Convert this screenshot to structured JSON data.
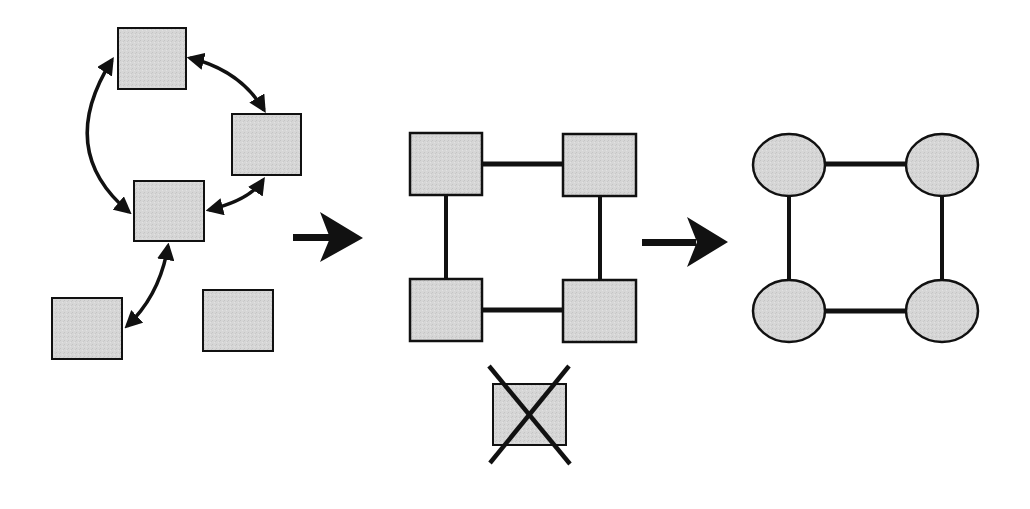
{
  "diagram": {
    "title": "",
    "background": "#ffffff",
    "colors": {
      "node_fill": "#d4d4d4",
      "stroke": "#111111"
    },
    "panels": [
      {
        "id": "unstructured",
        "description": "Five square nodes, four connected in a ring by curved double-headed arrows, one isolated",
        "nodes": [
          {
            "id": "A",
            "shape": "square",
            "x": 118,
            "y": 28,
            "w": 68,
            "h": 61
          },
          {
            "id": "B",
            "shape": "square",
            "x": 232,
            "y": 114,
            "w": 69,
            "h": 61
          },
          {
            "id": "C",
            "shape": "square",
            "x": 134,
            "y": 181,
            "w": 70,
            "h": 60
          },
          {
            "id": "D",
            "shape": "square",
            "x": 52,
            "y": 298,
            "w": 70,
            "h": 61
          },
          {
            "id": "E",
            "shape": "square",
            "x": 203,
            "y": 290,
            "w": 70,
            "h": 61
          }
        ],
        "edges": [
          {
            "from": "A",
            "to": "B",
            "type": "curved-double-arrow"
          },
          {
            "from": "B",
            "to": "C",
            "type": "curved-double-arrow"
          },
          {
            "from": "A",
            "to": "C",
            "type": "curved-double-arrow"
          },
          {
            "from": "C",
            "to": "D",
            "type": "curved-double-arrow"
          }
        ]
      },
      {
        "id": "square-grid",
        "description": "Four square nodes connected in a square; one removed (crossed out) node below",
        "nodes": [
          {
            "id": "TL",
            "shape": "square",
            "x": 410,
            "y": 133,
            "w": 72,
            "h": 62
          },
          {
            "id": "TR",
            "shape": "square",
            "x": 563,
            "y": 134,
            "w": 73,
            "h": 62
          },
          {
            "id": "BL",
            "shape": "square",
            "x": 410,
            "y": 279,
            "w": 72,
            "h": 62
          },
          {
            "id": "BR",
            "shape": "square",
            "x": 563,
            "y": 280,
            "w": 73,
            "h": 62
          },
          {
            "id": "X",
            "shape": "square",
            "x": 493,
            "y": 384,
            "w": 73,
            "h": 61,
            "crossed_out": true
          }
        ],
        "edges": [
          {
            "from": "TL",
            "to": "TR",
            "type": "line"
          },
          {
            "from": "TR",
            "to": "BR",
            "type": "line"
          },
          {
            "from": "BR",
            "to": "BL",
            "type": "line"
          },
          {
            "from": "BL",
            "to": "TL",
            "type": "line"
          }
        ]
      },
      {
        "id": "ellipse-graph",
        "description": "Four elliptical nodes connected in a square",
        "nodes": [
          {
            "id": "TL",
            "shape": "ellipse",
            "cx": 789,
            "cy": 165,
            "rx": 36,
            "ry": 31
          },
          {
            "id": "TR",
            "shape": "ellipse",
            "cx": 942,
            "cy": 165,
            "rx": 36,
            "ry": 31
          },
          {
            "id": "BL",
            "shape": "ellipse",
            "cx": 789,
            "cy": 311,
            "rx": 36,
            "ry": 31
          },
          {
            "id": "BR",
            "shape": "ellipse",
            "cx": 942,
            "cy": 311,
            "rx": 36,
            "ry": 31
          }
        ],
        "edges": [
          {
            "from": "TL",
            "to": "TR",
            "type": "line"
          },
          {
            "from": "TR",
            "to": "BR",
            "type": "line"
          },
          {
            "from": "BR",
            "to": "BL",
            "type": "line"
          },
          {
            "from": "BL",
            "to": "TL",
            "type": "line"
          }
        ]
      }
    ],
    "transitions": [
      {
        "from": "unstructured",
        "to": "square-grid",
        "icon": "right-arrow-icon"
      },
      {
        "from": "square-grid",
        "to": "ellipse-graph",
        "icon": "right-arrow-icon"
      }
    ]
  }
}
